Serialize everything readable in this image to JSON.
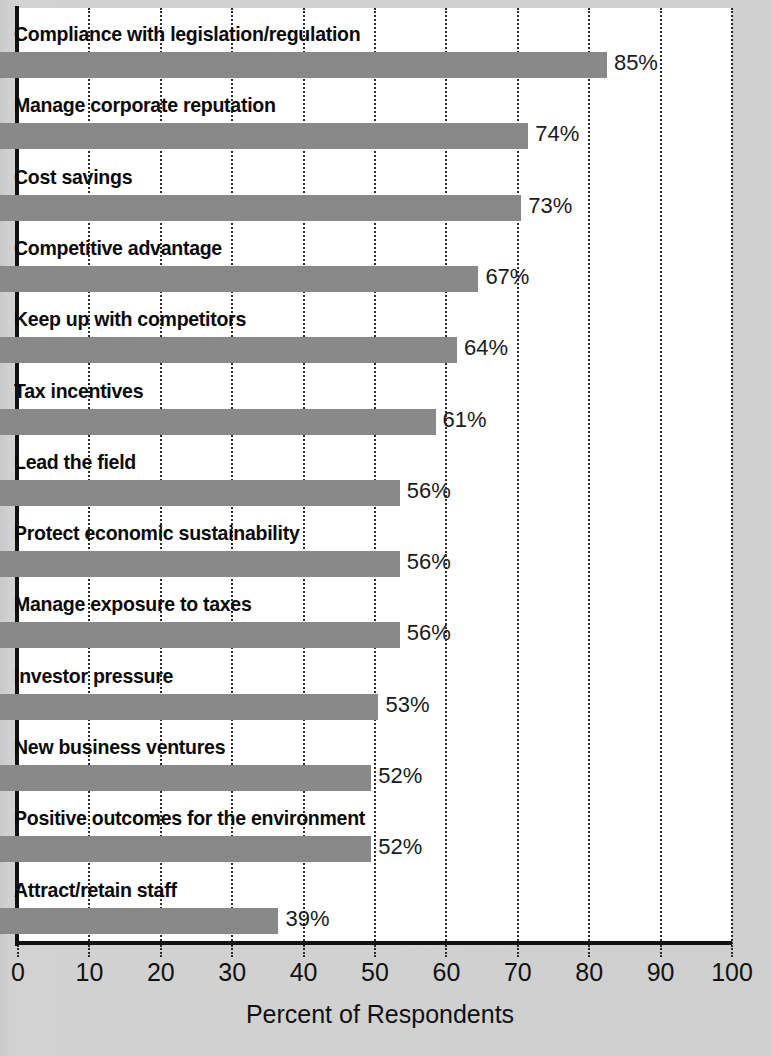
{
  "chart_data": {
    "type": "bar",
    "orientation": "horizontal",
    "title": "",
    "xlabel": "Percent of Respondents",
    "ylabel": "",
    "xlim": [
      0,
      100
    ],
    "xticks": [
      "0",
      "10",
      "20",
      "30",
      "40",
      "50",
      "60",
      "70",
      "80",
      "90",
      "100"
    ],
    "grid": true,
    "legend": "none",
    "bar_color": "#898989",
    "categories": [
      "Compliance with legislation/regulation",
      "Manage corporate reputation",
      "Cost savings",
      "Competitive advantage",
      "Keep up with competitors",
      "Tax incentives",
      "Lead the field",
      "Protect economic sustainability",
      "Manage exposure to taxes",
      "Investor pressure",
      "New business ventures",
      "Positive outcomes for the environment",
      "Attract/retain staff"
    ],
    "values": [
      85,
      74,
      73,
      67,
      64,
      61,
      56,
      56,
      56,
      53,
      52,
      52,
      39
    ],
    "value_labels": [
      "85%",
      "74%",
      "73%",
      "67%",
      "64%",
      "61%",
      "56%",
      "56%",
      "56%",
      "53%",
      "52%",
      "52%",
      "39%"
    ]
  }
}
